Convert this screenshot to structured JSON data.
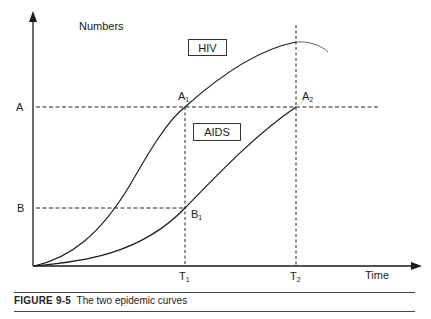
{
  "figure": {
    "number_label": "FIGURE 9-5",
    "caption_text": "The two epidemic curves"
  },
  "axes": {
    "y_label": "Numbers",
    "x_label": "Time"
  },
  "curve_labels": {
    "hiv": "HIV",
    "aids": "AIDS"
  },
  "levels": {
    "a": "A",
    "b": "B"
  },
  "points": {
    "a1": {
      "base": "A",
      "sub": "1"
    },
    "a2": {
      "base": "A",
      "sub": "2"
    },
    "b1": {
      "base": "B",
      "sub": "1"
    }
  },
  "times": {
    "t1": {
      "base": "T",
      "sub": "1"
    },
    "t2": {
      "base": "T",
      "sub": "2"
    }
  },
  "colors": {
    "ink": "#1a1a1a",
    "background": "#ffffff"
  }
}
